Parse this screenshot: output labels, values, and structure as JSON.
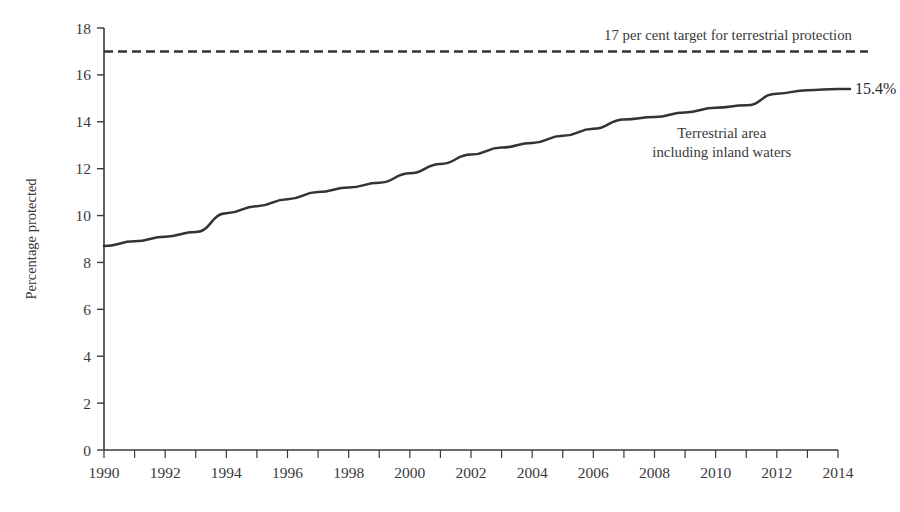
{
  "chart_data": {
    "type": "line",
    "title": "",
    "subtitle": "",
    "xlabel": "",
    "ylabel": "Percentage protected",
    "xlim": [
      1990,
      2014
    ],
    "ylim": [
      0,
      18
    ],
    "ytick_step": 2,
    "xtick_step": 2,
    "x_minor_tick_step": 1,
    "grid": false,
    "legend_position": "inline-annotation",
    "x": [
      1990,
      1991,
      1992,
      1993,
      1994,
      1995,
      1996,
      1997,
      1998,
      1999,
      2000,
      2001,
      2002,
      2003,
      2004,
      2005,
      2006,
      2007,
      2008,
      2009,
      2010,
      2011,
      2012,
      2013,
      2014
    ],
    "series": [
      {
        "name": "Terrestrial area including inland waters",
        "values": [
          8.7,
          8.9,
          9.1,
          9.3,
          10.1,
          10.4,
          10.7,
          11.0,
          11.2,
          11.4,
          11.8,
          12.2,
          12.6,
          12.9,
          13.1,
          13.4,
          13.7,
          14.1,
          14.2,
          14.4,
          14.6,
          14.7,
          15.2,
          15.35,
          15.4
        ]
      }
    ],
    "reference_lines": [
      {
        "name": "17 per cent target for terrestrial protection",
        "value": 17,
        "style": "dashed",
        "label": "17 per cent target for terrestrial protection"
      }
    ],
    "annotations": [
      {
        "name": "series-end-value",
        "text": "15.4%",
        "x": 2014,
        "y": 15.4
      },
      {
        "name": "series-label-line1",
        "text": "Terrestrial area",
        "x": 2010.2,
        "y": 13.3
      },
      {
        "name": "series-label-line2",
        "text": "including inland waters",
        "x": 2010.2,
        "y": 12.5
      }
    ],
    "ytick_labels": [
      "0",
      "2",
      "4",
      "6",
      "8",
      "10",
      "12",
      "14",
      "16",
      "18"
    ],
    "ytick_values": [
      0,
      2,
      4,
      6,
      8,
      10,
      12,
      14,
      16,
      18
    ],
    "xtick_labels": [
      "1990",
      "1992",
      "1994",
      "1996",
      "1998",
      "2000",
      "2002",
      "2004",
      "2006",
      "2008",
      "2010",
      "2012",
      "2014"
    ],
    "xtick_values": [
      1990,
      1992,
      1994,
      1996,
      1998,
      2000,
      2002,
      2004,
      2006,
      2008,
      2010,
      2012,
      2014
    ],
    "colors": {
      "series": "#333333",
      "target": "#333333",
      "axis": "#3a3a3a",
      "text": "#3a3a3a",
      "background": "#ffffff"
    }
  }
}
